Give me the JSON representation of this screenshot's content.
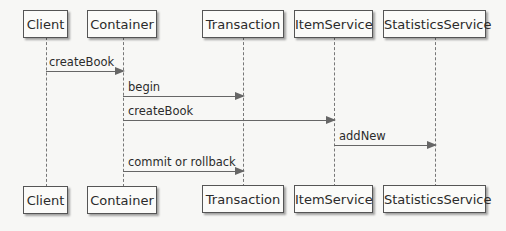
{
  "diagram": {
    "type": "sequence",
    "participants": [
      {
        "name": "Client",
        "x": 46
      },
      {
        "name": "Container",
        "x": 123
      },
      {
        "name": "Transaction",
        "x": 243
      },
      {
        "name": "ItemService",
        "x": 334
      },
      {
        "name": "StatisticsService",
        "x": 435
      }
    ],
    "messages": [
      {
        "label": "createBook",
        "from": "Client",
        "to": "Container"
      },
      {
        "label": "begin",
        "from": "Container",
        "to": "Transaction"
      },
      {
        "label": "createBook",
        "from": "Container",
        "to": "ItemService"
      },
      {
        "label": "addNew",
        "from": "ItemService",
        "to": "StatisticsService"
      },
      {
        "label": "commit or rollback",
        "from": "Container",
        "to": "Transaction"
      }
    ]
  }
}
